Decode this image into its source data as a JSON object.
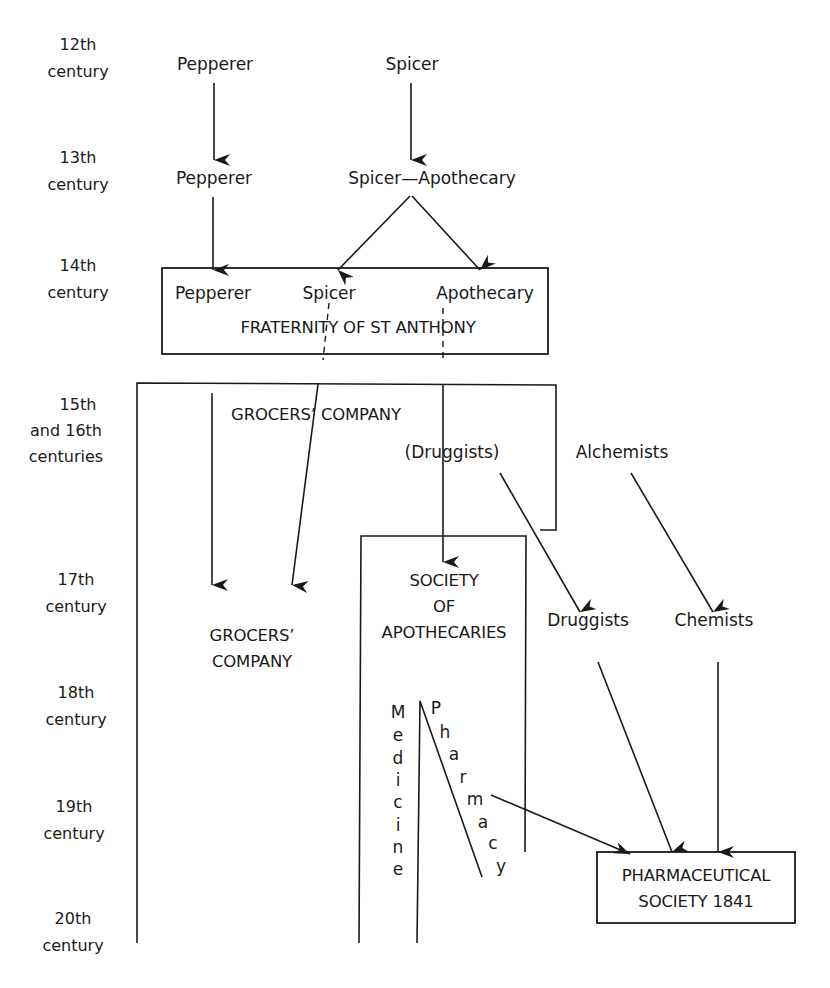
{
  "centuries": [
    {
      "line1": "12th",
      "line2": "century"
    },
    {
      "line1": "13th",
      "line2": "century"
    },
    {
      "line1": "14th",
      "line2": "century"
    },
    {
      "line1": "15th",
      "line2": "and 16th",
      "line3": "centuries"
    },
    {
      "line1": "17th",
      "line2": "century"
    },
    {
      "line1": "18th",
      "line2": "century"
    },
    {
      "line1": "19th",
      "line2": "century"
    },
    {
      "line1": "20th",
      "line2": "century"
    }
  ],
  "c12": {
    "pepperer": "Pepperer",
    "spicer": "Spicer"
  },
  "c13": {
    "pepperer": "Pepperer",
    "spicer_apothecary": "Spicer—Apothecary"
  },
  "fraternity": {
    "pepperer": "Pepperer",
    "spicer": "Spicer",
    "apothecary": "Apothecary",
    "title": "FRATERNITY OF ST ANTHONY"
  },
  "c15": {
    "grocers_company": "GROCERS’ COMPANY",
    "druggists_paren": "(Druggists)",
    "alchemists": "Alchemists"
  },
  "c17": {
    "grocers_line1": "GROCERS’",
    "grocers_line2": "COMPANY",
    "society_line1": "SOCIETY",
    "society_line2": "OF",
    "society_line3": "APOTHECARIES",
    "druggists": "Druggists",
    "chemists": "Chemists"
  },
  "split": {
    "medicine": [
      "M",
      "e",
      "d",
      "i",
      "c",
      "i",
      "n",
      "e"
    ],
    "pharmacy": [
      "P",
      "h",
      "a",
      "r",
      "m",
      "a",
      "c",
      "y"
    ]
  },
  "pharmaceutical_society": {
    "line1": "PHARMACEUTICAL",
    "line2": "SOCIETY 1841"
  }
}
